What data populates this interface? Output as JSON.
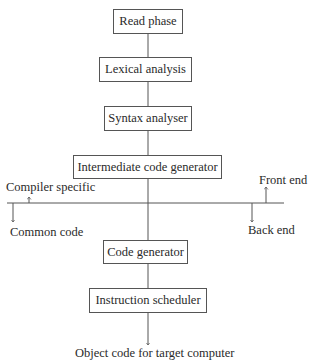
{
  "diagram": {
    "title": "",
    "boxes": [
      {
        "id": "read",
        "label": "Read phase"
      },
      {
        "id": "lexical",
        "label": "Lexical analysis"
      },
      {
        "id": "syntax",
        "label": "Syntax analyser"
      },
      {
        "id": "intermediate",
        "label": "Intermediate code generator"
      },
      {
        "id": "codegen",
        "label": "Code generator"
      },
      {
        "id": "scheduler",
        "label": "Instruction scheduler"
      }
    ],
    "divider_labels": {
      "compiler_specific": "Compiler specific",
      "common_code": "Common code",
      "front_end": "Front end",
      "back_end": "Back end"
    },
    "output_label": "Object code for target computer",
    "line_color": "#555555"
  }
}
